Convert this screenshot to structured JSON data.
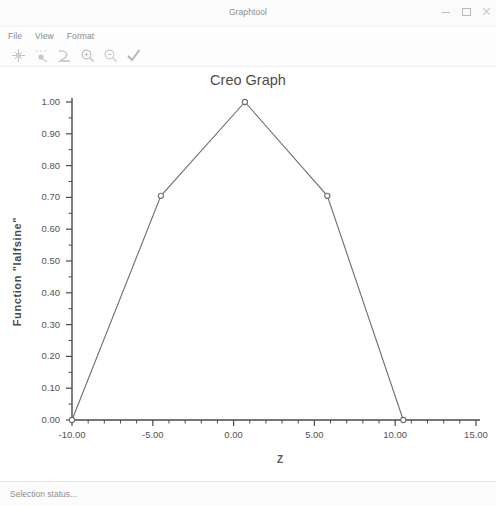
{
  "window": {
    "title": "Graphtool",
    "controls": [
      {
        "name": "minimize",
        "label": "—"
      },
      {
        "name": "maximize",
        "label": "□"
      },
      {
        "name": "close",
        "label": "✕"
      }
    ]
  },
  "menu": {
    "items": [
      {
        "label": "File"
      },
      {
        "label": "View"
      },
      {
        "label": "Format"
      }
    ]
  },
  "toolbar": {
    "buttons": [
      {
        "icon": "pan-graph-icon",
        "tooltip": "Pan"
      },
      {
        "icon": "point-select-icon",
        "tooltip": "Select point"
      },
      {
        "icon": "curve-icon",
        "tooltip": "Curve"
      },
      {
        "icon": "zoom-in-icon",
        "tooltip": "Zoom in"
      },
      {
        "icon": "zoom-out-icon",
        "tooltip": "Zoom out"
      },
      {
        "icon": "checkmark-icon",
        "tooltip": "Accept"
      }
    ]
  },
  "statusbar": {
    "text": "Selection status..."
  },
  "chart_data": {
    "type": "line",
    "title": "Creo Graph",
    "xlabel": "Z",
    "ylabel": "Function \"lalfsine\"",
    "xlim": [
      -10.0,
      15.0
    ],
    "ylim": [
      0.0,
      1.0
    ],
    "xticks": [
      -10.0,
      -5.0,
      0.0,
      5.0,
      10.0,
      15.0
    ],
    "xtick_labels": [
      "-10.00",
      "-5.00",
      "0.00",
      "5.00",
      "10.00",
      "15.00"
    ],
    "yticks": [
      0.0,
      0.1,
      0.2,
      0.3,
      0.4,
      0.5,
      0.6,
      0.7,
      0.8,
      0.9,
      1.0
    ],
    "ytick_labels": [
      "0.00",
      "0.10",
      "0.20",
      "0.30",
      "0.40",
      "0.50",
      "0.60",
      "0.70",
      "0.80",
      "0.90",
      "1.00"
    ],
    "grid": false,
    "legend": null,
    "minor_ticks": true,
    "series": [
      {
        "name": "lalfsine",
        "marker": "circle",
        "color": "#6e6e6e",
        "x": [
          -10.0,
          -4.5,
          0.7,
          5.8,
          10.5
        ],
        "y": [
          0.0,
          0.705,
          1.0,
          0.705,
          0.0
        ]
      }
    ]
  }
}
